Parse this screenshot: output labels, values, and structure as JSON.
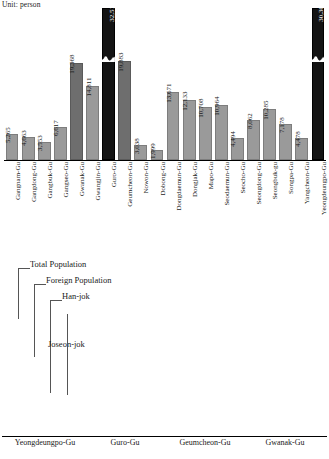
{
  "unit_note": "Unit: person",
  "chart_data": [
    {
      "type": "bar",
      "title": "",
      "subtitle": "",
      "xlabel": "",
      "ylabel": "",
      "unit": "Unit: person",
      "grid": false,
      "legend_position": "none",
      "axis_break": true,
      "ylim": [
        0,
        32512
      ],
      "categories": [
        "Gangnam-Gu",
        "Gangdong-Gu",
        "Gangbuk-Gu",
        "Gangseo-Gu",
        "Gwanak-Gu",
        "Gwangjin-Gu",
        "Guro-Gu",
        "Geumcheon-Gu",
        "Nowon-Gu",
        "Dobong-Gu",
        "Dongdaemun-Gu",
        "Dongjak-Gu",
        "Mapo-Gu",
        "Seodaemun-Gu",
        "Seocho-Gu",
        "Seongdong-Gu",
        "Seongbuk-gu",
        "Songpa-Gu",
        "Yangcheon-Gu",
        "Yeongdeungpo-Gu"
      ],
      "values": [
        5265,
        4663,
        3553,
        6617,
        19368,
        14811,
        32512,
        19883,
        3038,
        1999,
        13671,
        12133,
        10708,
        10964,
        4494,
        8062,
        10285,
        7178,
        4478,
        30307
      ],
      "value_labels": [
        "5,265",
        "4,663",
        "3,553",
        "6,617",
        "19,368",
        "14,811",
        "32,512",
        "19,883",
        "3,038",
        "1,999",
        "13,671",
        "12,133",
        "10,708",
        "10,964",
        "4,494",
        "8,062",
        "10,285",
        "7,178",
        "4,478",
        "30,307"
      ],
      "highlighted": [
        "Guro-Gu",
        "Yeongdeungpo-Gu"
      ],
      "colors": {
        "bar": "#8c8c8c",
        "highlight": "#141414"
      }
    },
    {
      "type": "bar",
      "title": "",
      "xlabel": "",
      "ylabel": "",
      "grid": false,
      "legend_position": "inline-callout",
      "axis_break": true,
      "categories": [
        "Yeongdeungpo-Gu",
        "Guro-Gu",
        "Geumcheon-Gu",
        "Gwanak-Gu"
      ],
      "series": [
        {
          "name": "Total Population",
          "values": [
            406528,
            444882,
            250690,
            519622
          ],
          "labels": [
            "406,528",
            "444,882",
            "250,690",
            "519,622"
          ],
          "color": "#8f8f8f"
        },
        {
          "name": "Foreign Population",
          "values": [
            30307,
            32512,
            19883,
            19368
          ],
          "labels": [
            "30,307",
            "32,512",
            "19,883",
            "19,368"
          ],
          "color": "#2b2b2b"
        },
        {
          "name": "Han-jok",
          "values": [
            5323,
            4768,
            2431,
            3357
          ],
          "labels": [
            "5,323",
            "4,768",
            "2,431",
            "3,357"
          ],
          "color": "#1a1a1a"
        },
        {
          "name": "Joseon-jok",
          "values": [
            32057,
            26135,
            16207,
            12647
          ],
          "labels": [
            "32,057",
            "26,135",
            "16,207",
            "12,647"
          ],
          "color": "#d4d4d4"
        }
      ]
    }
  ],
  "top": {
    "bars": [
      {
        "label": "Gangnam-Gu",
        "value_label": "5,265",
        "h": 26,
        "style": "light",
        "break": false,
        "inside": false
      },
      {
        "label": "Gangdong-Gu",
        "value_label": "4,663",
        "h": 23,
        "style": "light",
        "break": false,
        "inside": false
      },
      {
        "label": "Gangbuk-Gu",
        "value_label": "3,553",
        "h": 18,
        "style": "light",
        "break": false,
        "inside": false
      },
      {
        "label": "Gangseo-Gu",
        "value_label": "6,617",
        "h": 33,
        "style": "light",
        "break": false,
        "inside": false
      },
      {
        "label": "Gwanak-Gu",
        "value_label": "19,368",
        "h": 97,
        "style": "mid",
        "break": false,
        "inside": false
      },
      {
        "label": "Gwangjin-Gu",
        "value_label": "14,811",
        "h": 74,
        "style": "light",
        "break": false,
        "inside": false
      },
      {
        "label": "Guro-Gu",
        "value_label": "32,512",
        "h": 152,
        "style": "dark",
        "break": true,
        "inside": true
      },
      {
        "label": "Geumcheon-Gu",
        "value_label": "19,883",
        "h": 99,
        "style": "mid",
        "break": false,
        "inside": false
      },
      {
        "label": "Nowon-Gu",
        "value_label": "3,038",
        "h": 15,
        "style": "light",
        "break": false,
        "inside": false
      },
      {
        "label": "Dobong-Gu",
        "value_label": "1,999",
        "h": 10,
        "style": "light",
        "break": false,
        "inside": false
      },
      {
        "label": "Dongdaemun-Gu",
        "value_label": "13,671",
        "h": 68,
        "style": "light",
        "break": false,
        "inside": false
      },
      {
        "label": "Dongjak-Gu",
        "value_label": "12,133",
        "h": 60,
        "style": "light",
        "break": false,
        "inside": false
      },
      {
        "label": "Mapo-Gu",
        "value_label": "10,708",
        "h": 53,
        "style": "light",
        "break": false,
        "inside": false
      },
      {
        "label": "Seodaemun-Gu",
        "value_label": "10,964",
        "h": 55,
        "style": "light",
        "break": false,
        "inside": false
      },
      {
        "label": "Seocho-Gu",
        "value_label": "4,494",
        "h": 22,
        "style": "light",
        "break": false,
        "inside": false
      },
      {
        "label": "Seongdong-Gu",
        "value_label": "8,062",
        "h": 40,
        "style": "light",
        "break": false,
        "inside": false
      },
      {
        "label": "Seongbuk-gu",
        "value_label": "10,285",
        "h": 51,
        "style": "light",
        "break": false,
        "inside": false
      },
      {
        "label": "Songpa-Gu",
        "value_label": "7,178",
        "h": 36,
        "style": "light",
        "break": false,
        "inside": false
      },
      {
        "label": "Yangcheon-Gu",
        "value_label": "4,478",
        "h": 22,
        "style": "light",
        "break": false,
        "inside": false
      },
      {
        "label": "Yeongdeungpo-Gu",
        "value_label": "30,307",
        "h": 152,
        "style": "dark",
        "break": true,
        "inside": true
      }
    ]
  },
  "bottom": {
    "legend": [
      {
        "name": "legend-total",
        "label": "Total Population"
      },
      {
        "name": "legend-foreign",
        "label": "Foreign Population"
      },
      {
        "name": "legend-hanjok",
        "label": "Han-jok"
      },
      {
        "name": "legend-joseonjok",
        "label": "Joseon-jok"
      }
    ],
    "groups": [
      {
        "label": "Yeongdeungpo-Gu",
        "bars": [
          {
            "series": "total",
            "value_label": "406,528",
            "h": 125,
            "break": true,
            "inside": true
          },
          {
            "series": "foreign",
            "value_label": "30,307",
            "h": 35,
            "break": false,
            "inside": false
          },
          {
            "series": "han",
            "value_label": "5,323",
            "h": 8,
            "break": false,
            "inside": false
          },
          {
            "series": "joseon",
            "value_label": "32,057",
            "h": 23,
            "break": false,
            "inside": false
          }
        ]
      },
      {
        "label": "Guro-Gu",
        "bars": [
          {
            "series": "total",
            "value_label": "444,882",
            "h": 140,
            "break": true,
            "inside": true
          },
          {
            "series": "foreign",
            "value_label": "32,512",
            "h": 37,
            "break": false,
            "inside": false
          },
          {
            "series": "han",
            "value_label": "4,768",
            "h": 8,
            "break": false,
            "inside": false
          },
          {
            "series": "joseon",
            "value_label": "26,135",
            "h": 20,
            "break": false,
            "inside": false
          }
        ]
      },
      {
        "label": "Geumcheon-Gu",
        "bars": [
          {
            "series": "total",
            "value_label": "250,690",
            "h": 113,
            "break": true,
            "inside": false
          },
          {
            "series": "foreign",
            "value_label": "19,883",
            "h": 23,
            "break": false,
            "inside": false
          },
          {
            "series": "han",
            "value_label": "2,431",
            "h": 6,
            "break": false,
            "inside": false
          },
          {
            "series": "joseon",
            "value_label": "16,207",
            "h": 13,
            "break": false,
            "inside": false
          }
        ]
      },
      {
        "label": "Gwanak-Gu",
        "bars": [
          {
            "series": "total",
            "value_label": "519,622",
            "h": 152,
            "break": true,
            "inside": false
          },
          {
            "series": "foreign",
            "value_label": "19,368",
            "h": 23,
            "break": false,
            "inside": false
          },
          {
            "series": "han",
            "value_label": "3,357",
            "h": 7,
            "break": false,
            "inside": false
          },
          {
            "series": "joseon",
            "value_label": "12,647",
            "h": 11,
            "break": false,
            "inside": false
          }
        ]
      }
    ]
  }
}
